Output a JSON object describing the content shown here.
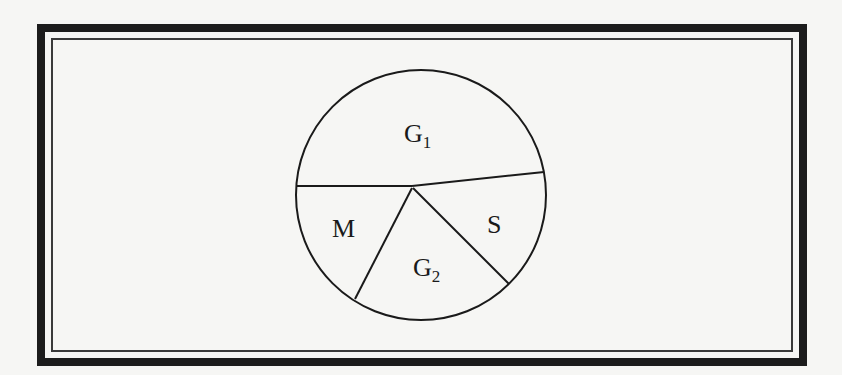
{
  "diagram": {
    "type": "circle-divided-into-regions",
    "regions": [
      {
        "label": "G",
        "subscript": "1"
      },
      {
        "label": "S",
        "subscript": ""
      },
      {
        "label": "G",
        "subscript": "2"
      },
      {
        "label": "M",
        "subscript": ""
      }
    ]
  }
}
